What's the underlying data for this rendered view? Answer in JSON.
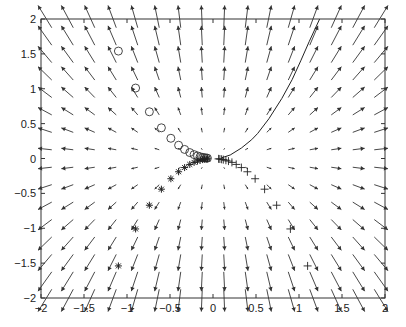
{
  "chart_data": {
    "type": "scatter",
    "title": "",
    "xlabel": "",
    "ylabel": "",
    "xlim": [
      -2,
      2
    ],
    "ylim": [
      -2,
      2
    ],
    "grid": false,
    "legend": null,
    "xticks": [
      -2,
      -1.5,
      -1,
      -0.5,
      0,
      0.5,
      1,
      1.5,
      2
    ],
    "yticks": [
      -2,
      -1.5,
      -1,
      -0.5,
      0,
      0.5,
      1,
      1.5,
      2
    ],
    "xtick_labels": [
      "−2",
      "−1.5",
      "−1",
      "−0.5",
      "0",
      "0.5",
      "1",
      "1.5",
      "2"
    ],
    "ytick_labels": [
      "−2",
      "−1.5",
      "−1",
      "−0.5",
      "0",
      "0.5",
      "1",
      "1.5",
      "2"
    ],
    "vector_field": {
      "type": "quiver",
      "description": "dx/dt = x, dy/dt = 2y",
      "grid_x": [
        -1.875,
        -1.625,
        -1.375,
        -1.125,
        -0.875,
        -0.625,
        -0.375,
        -0.125,
        0.125,
        0.375,
        0.625,
        0.875,
        1.125,
        1.375,
        1.625,
        1.875
      ],
      "grid_y": [
        -1.875,
        -1.625,
        -1.375,
        -1.125,
        -0.875,
        -0.625,
        -0.375,
        -0.125,
        0.125,
        0.375,
        0.625,
        0.875,
        1.125,
        1.375,
        1.625,
        1.875
      ],
      "u_coeff": 1,
      "v_coeff": 2,
      "color": "#333333"
    },
    "series": [
      {
        "name": "circles",
        "marker": "o",
        "x": [
          -1.1,
          -0.9,
          -0.74,
          -0.6,
          -0.49,
          -0.4,
          -0.33,
          -0.27,
          -0.22,
          -0.18,
          -0.15,
          -0.12,
          -0.1,
          -0.08,
          -0.065
        ],
        "y": [
          1.54,
          1.01,
          0.67,
          0.44,
          0.29,
          0.19,
          0.13,
          0.085,
          0.056,
          0.037,
          0.025,
          0.016,
          0.011,
          0.007,
          0.005
        ]
      },
      {
        "name": "stars",
        "marker": "*",
        "x": [
          -1.1,
          -0.9,
          -0.74,
          -0.6,
          -0.49,
          -0.4,
          -0.33,
          -0.27,
          -0.22,
          -0.18,
          -0.15,
          -0.12,
          -0.1,
          -0.08,
          -0.065
        ],
        "y": [
          -1.54,
          -1.01,
          -0.67,
          -0.44,
          -0.29,
          -0.19,
          -0.13,
          -0.085,
          -0.056,
          -0.037,
          -0.025,
          -0.016,
          -0.011,
          -0.007,
          -0.005
        ]
      },
      {
        "name": "plus",
        "marker": "+",
        "x": [
          1.1,
          0.9,
          0.74,
          0.6,
          0.49,
          0.4,
          0.33,
          0.27,
          0.22,
          0.18,
          0.15,
          0.12,
          0.1,
          0.08,
          0.065
        ],
        "y": [
          -1.54,
          -1.01,
          -0.67,
          -0.44,
          -0.29,
          -0.19,
          -0.13,
          -0.085,
          -0.056,
          -0.037,
          -0.025,
          -0.016,
          -0.011,
          -0.007,
          -0.005
        ]
      },
      {
        "name": "trajectory",
        "marker": "line",
        "x": [
          0.1,
          0.2,
          0.33,
          0.45,
          0.52,
          0.65,
          0.8,
          0.92,
          1.02,
          1.12,
          1.24
        ],
        "y": [
          0.01,
          0.05,
          0.15,
          0.27,
          0.36,
          0.57,
          0.86,
          1.13,
          1.4,
          1.68,
          2.0
        ]
      }
    ]
  }
}
